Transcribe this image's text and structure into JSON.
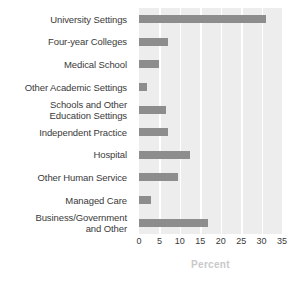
{
  "chart_data": {
    "type": "bar",
    "orientation": "horizontal",
    "title": "",
    "xlabel": "Percent",
    "ylabel": "",
    "xlim": [
      0,
      35
    ],
    "xticks": [
      "0",
      "5",
      "10",
      "15",
      "20",
      "25",
      "30",
      "35"
    ],
    "grid": true,
    "legend": "none",
    "categories": [
      "University Settings",
      "Four-year Colleges",
      "Medical School",
      "Other Academic Settings",
      "Schools and Other\nEducation Settings",
      "Independent Practice",
      "Hospital",
      "Other Human Service",
      "Managed Care",
      "Business/Government\nand Other"
    ],
    "values": [
      31,
      7,
      5,
      2,
      6.5,
      7,
      12.5,
      9.5,
      3,
      17
    ],
    "colors": {
      "bar": "#8d8d8d",
      "plot_background": "#ededed",
      "gridline": "#ffffff",
      "label_text": "#3a3a3a",
      "axis_title": "#c9c9c9"
    }
  }
}
